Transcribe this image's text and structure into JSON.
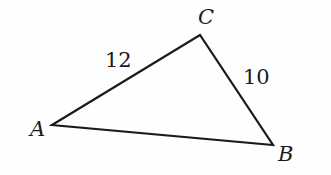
{
  "diagram": {
    "type": "triangle",
    "vertices": [
      {
        "name": "A",
        "x": 52,
        "y": 125
      },
      {
        "name": "B",
        "x": 273,
        "y": 145
      },
      {
        "name": "C",
        "x": 200,
        "y": 35
      }
    ],
    "vertex_labels": {
      "A": "A",
      "B": "B",
      "C": "C"
    },
    "side_labels": {
      "AC": "12",
      "CB": "10"
    },
    "stroke_color": "#1a1a1a"
  }
}
